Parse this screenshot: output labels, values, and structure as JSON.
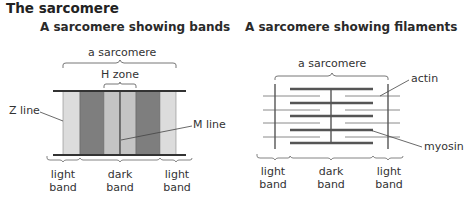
{
  "title": "The sarcomere",
  "left_diagram": {
    "heading": "A sarcomere showing bands",
    "sarcomere_label": "a sarcomere",
    "h_zone_label": "H zone",
    "z_line_label": "Z line",
    "m_line_label": "M line",
    "band_labels": [
      {
        "line1": "light",
        "line2": "band"
      },
      {
        "line1": "dark",
        "line2": "band"
      },
      {
        "line1": "light",
        "line2": "band"
      }
    ],
    "colors": {
      "light_band": "#dcdcdc",
      "h_zone": "#c4c4c4",
      "dark_band": "#7e7e7e",
      "line": "#444444"
    }
  },
  "right_diagram": {
    "heading": "A sarcomere showing filaments",
    "sarcomere_label": "a sarcomere",
    "actin_label": "actin",
    "myosin_label": "myosin",
    "band_labels": [
      {
        "line1": "light",
        "line2": "band"
      },
      {
        "line1": "dark",
        "line2": "band"
      },
      {
        "line1": "light",
        "line2": "band"
      }
    ],
    "colors": {
      "myosin": "#555555",
      "actin": "#8a8a8a",
      "z_line": "#555555"
    }
  }
}
